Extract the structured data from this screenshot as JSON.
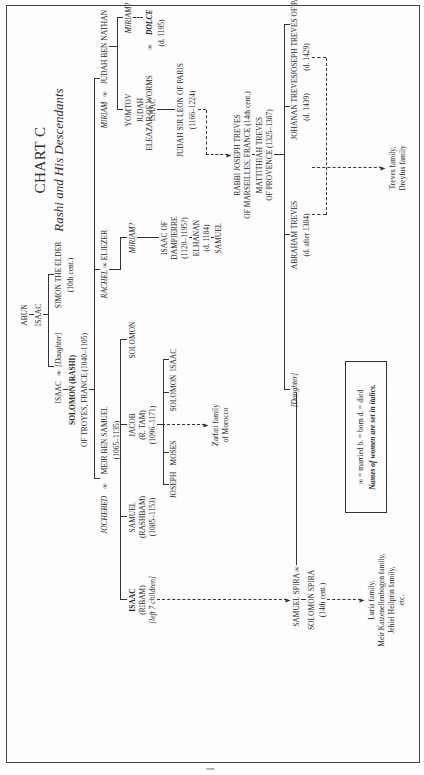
{
  "chart": {
    "title": "CHART C",
    "subtitle": "Rashi and His Descendants",
    "orientation": "rotated 90° counter-clockwise on page"
  },
  "people": {
    "abun": "ABUN",
    "isaac_father": "ISAAC",
    "simon_elder": "SIMON THE ELDER",
    "simon_elder_dates": "(10th cent.)",
    "isaac_rashi_father": "ISAAC",
    "married_symbol": "∞",
    "daughter_simon": "[Daughter]",
    "rashi": "SOLOMON (RASHI)",
    "rashi_place": "OF TROYES, FRANCE (1040–1105)",
    "jochebed": "JOCHEBED",
    "meir": "MEIR BEN SAMUEL",
    "meir_dates": "(1065–1135)",
    "rachel": "RACHEL",
    "eliezer": "ELIEZER",
    "miriam": "MIRIAM",
    "judah_ben_nathan": "JUDAH BEN NATHAN",
    "isaac_ribam": "ISAAC",
    "isaac_ribam_alias": "(RIBAM)",
    "isaac_ribam_note": "[left 7 children]",
    "samuel_rashbam": "SAMUEL",
    "samuel_rashbam_alias": "(RASHBAM)",
    "samuel_rashbam_dates": "(1085–1153)",
    "jacob": "JACOB",
    "jacob_alias": "(R. TAM)",
    "jacob_dates": "(1096–1171)",
    "solomon_son": "SOLOMON",
    "miriam_q": "MIRIAM?",
    "joseph": "JOSEPH",
    "moses": "MOSES",
    "solomon_gs": "SOLOMON",
    "isaac_gs": "ISAAC",
    "zarfati": "Zarfati family",
    "zarfati2": "of Morocco",
    "isaac_dampierre": "ISAAC OF",
    "isaac_dampierre2": "DAMPIERRE",
    "isaac_dampierre_dates": "(1120–1195?)",
    "elhanan": "ELHANAN",
    "elhanan_dates": "(d. 1184)",
    "samuel_gs": "SAMUEL",
    "yomtov": "YOMTOV",
    "judah": "JUDAH",
    "isaac_miriam": "ISAAC",
    "miriam_q2": "MIRIAM?",
    "dolce": "DOLCE",
    "dolce_dates": "(d. 1195)",
    "eleazar": "ELEAZAR OF WORMS",
    "eleazar_dates": "(1160–1230)",
    "anna": "ANNA",
    "anna_dates": "(d. 1212)",
    "bellette": "BELLETTE",
    "bellette_dates": "(d. 1213)",
    "judah_sir_leon": "JUDAH SIR LEON OF PARIS",
    "judah_sir_leon_dates": "(1166–1224)",
    "joseph_treves": "RABBI JOSEPH TREVES",
    "joseph_treves_place": "OF MARSEILLES, FRANCE (14th cent.)",
    "mattithiah": "MATTITHIAH TREVES",
    "mattithiah_place": "OF PROVENCE (1325–1387)",
    "daughter_spira": "[Daughter]",
    "abraham_treves": "ABRAHAM TREVES",
    "abraham_treves_dates": "(d. after 1384)",
    "johanan_treves": "JOHANAN TREVES",
    "johanan_treves_dates": "(d. 1439)",
    "joseph_treves_paris": "JOSEPH TREVES OF PARIS",
    "joseph_treves_paris_dates": "(d. 1429)",
    "treves_family": "Treves family,",
    "dreyfus_family": "Dreyfus family",
    "samuel_spira": "SAMUEL SPIRA",
    "solomon_spira": "SOLOMON SPIRA",
    "solomon_spira_dates": "(14th cent.)",
    "luria": "Luria family,",
    "katzenellenbogen": "Meir Katzenellenbogen family,",
    "heilprin": "Jehiel Heilprin family,",
    "etc": "etc."
  },
  "legend": {
    "line1": "∞ = married    b. = born    d. = died",
    "line2": "Names of women are set in italics."
  }
}
